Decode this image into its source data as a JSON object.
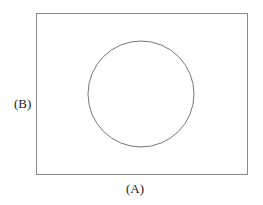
{
  "diagram": {
    "label_horizontal": "(A)",
    "label_vertical": "(B)",
    "shapes": {
      "rectangle": {
        "x": 36,
        "y": 13,
        "width": 212,
        "height": 162
      },
      "circle": {
        "cx": 141,
        "cy": 94,
        "r": 53
      }
    },
    "stroke_color": "#777777"
  }
}
